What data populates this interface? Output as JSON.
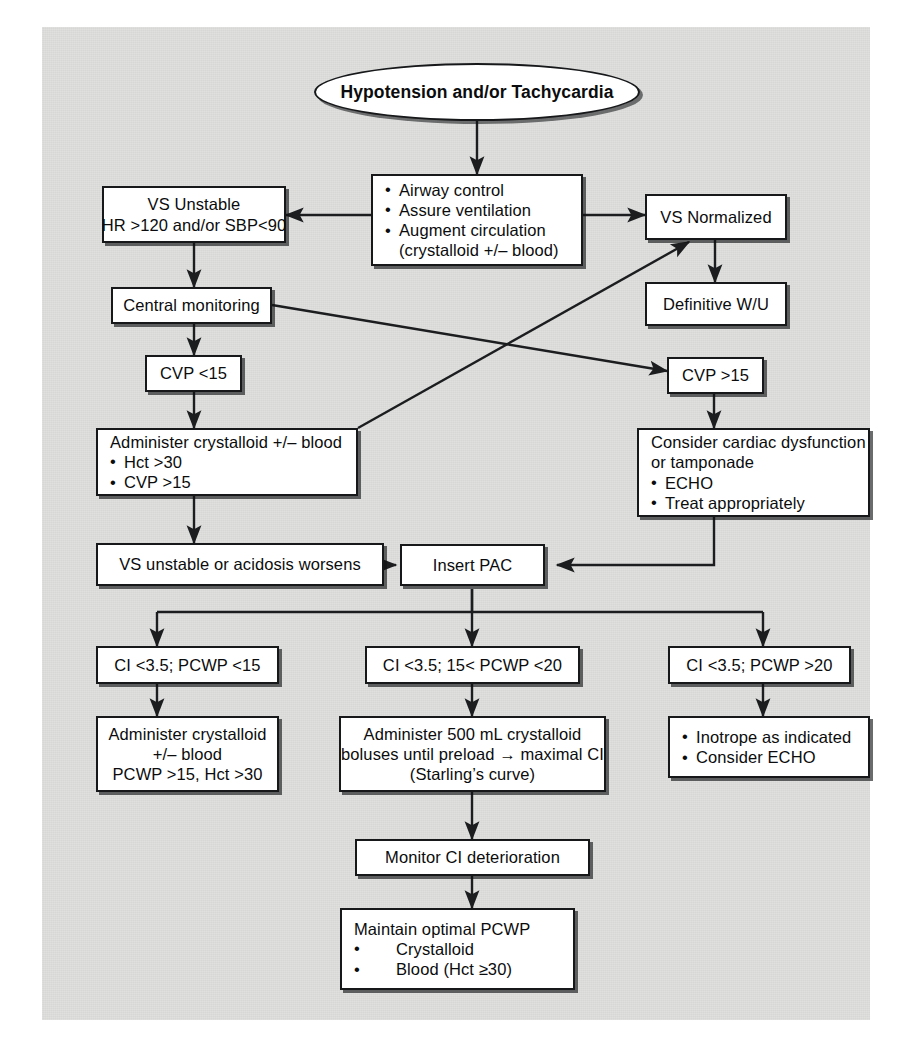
{
  "diagram": {
    "title": "Hypotension and/or Tachycardia",
    "colors": {
      "page_background": "#ffffff",
      "panel_background": "#dededd",
      "node_fill": "#ffffff",
      "node_border": "#16181a",
      "connector": "#1b1d1f",
      "text": "#0b0c0d"
    }
  },
  "nodes": {
    "start": {
      "label": "Hypotension and/or Tachycardia",
      "shape": "oval"
    },
    "initial_measures": {
      "lines": [
        "Airway control",
        "Assure ventilation",
        "Augment circulation"
      ],
      "sub": "(crystalloid +/– blood)"
    },
    "vs_unstable": {
      "line1": "VS Unstable",
      "line2": "HR >120 and/or SBP<90"
    },
    "vs_normalized": {
      "label": "VS Normalized"
    },
    "definitive_wu": {
      "label": "Definitive W/U"
    },
    "central_monitoring": {
      "label": "Central monitoring"
    },
    "cvp_low": {
      "label": "CVP <15"
    },
    "cvp_high": {
      "label": "CVP >15"
    },
    "administer_crystalloid": {
      "line1": "Administer crystalloid +/– blood",
      "bullets": [
        "Hct >30",
        "CVP >15"
      ]
    },
    "cardiac_dysfunction": {
      "line1": "Consider cardiac dysfunction",
      "line2": "or tamponade",
      "bullets": [
        "ECHO",
        "Treat appropriately"
      ]
    },
    "vs_unstable_acidosis": {
      "label": "VS unstable or acidosis worsens"
    },
    "insert_pac": {
      "label": "Insert PAC"
    },
    "branch_low": {
      "label": "CI <3.5; PCWP <15"
    },
    "branch_mid": {
      "label": "CI <3.5; 15< PCWP <20"
    },
    "branch_high": {
      "label": "CI <3.5; PCWP >20"
    },
    "treat_low": {
      "line1": "Administer crystalloid",
      "line2": "+/– blood",
      "line3": "PCWP >15, Hct >30"
    },
    "treat_mid": {
      "line1": "Administer 500 mL crystalloid",
      "line2": "boluses until preload → maximal CI",
      "line3": "(Starling’s curve)"
    },
    "treat_high": {
      "bullets": [
        "Inotrope as indicated",
        "Consider ECHO"
      ]
    },
    "monitor_ci": {
      "label": "Monitor CI deterioration"
    },
    "maintain_pcwp": {
      "line1": "Maintain optimal PCWP",
      "bullets": [
        "Crystalloid",
        "Blood (Hct ≥30)"
      ]
    }
  },
  "edges": [
    {
      "from": "start",
      "to": "initial_measures",
      "type": "arrow-down"
    },
    {
      "from": "initial_measures",
      "to": "vs_unstable",
      "type": "arrow-left"
    },
    {
      "from": "initial_measures",
      "to": "vs_normalized",
      "type": "arrow-right"
    },
    {
      "from": "vs_normalized",
      "to": "definitive_wu",
      "type": "arrow-down"
    },
    {
      "from": "vs_unstable",
      "to": "central_monitoring",
      "type": "arrow-down"
    },
    {
      "from": "central_monitoring",
      "to": "cvp_high",
      "type": "arrow-diagonal"
    },
    {
      "from": "central_monitoring",
      "to": "cvp_low",
      "type": "arrow-down"
    },
    {
      "from": "cvp_low",
      "to": "administer_crystalloid",
      "type": "arrow-down"
    },
    {
      "from": "administer_crystalloid",
      "to": "vs_normalized",
      "type": "arrow-diagonal"
    },
    {
      "from": "administer_crystalloid",
      "to": "vs_unstable_acidosis",
      "type": "arrow-down"
    },
    {
      "from": "cvp_high",
      "to": "cardiac_dysfunction",
      "type": "arrow-down"
    },
    {
      "from": "cardiac_dysfunction",
      "to": "insert_pac",
      "type": "arrow-elbow-left"
    },
    {
      "from": "vs_unstable_acidosis",
      "to": "insert_pac",
      "type": "arrow-right"
    },
    {
      "from": "insert_pac",
      "to": "branch_low",
      "type": "arrow-fork"
    },
    {
      "from": "insert_pac",
      "to": "branch_mid",
      "type": "arrow-fork"
    },
    {
      "from": "insert_pac",
      "to": "branch_high",
      "type": "arrow-fork"
    },
    {
      "from": "branch_low",
      "to": "treat_low",
      "type": "arrow-down"
    },
    {
      "from": "branch_mid",
      "to": "treat_mid",
      "type": "arrow-down"
    },
    {
      "from": "branch_high",
      "to": "treat_high",
      "type": "arrow-down"
    },
    {
      "from": "treat_mid",
      "to": "monitor_ci",
      "type": "arrow-down"
    },
    {
      "from": "monitor_ci",
      "to": "maintain_pcwp",
      "type": "arrow-down"
    }
  ]
}
